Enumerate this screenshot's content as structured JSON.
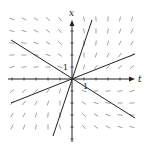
{
  "diagram": {
    "type": "direction-field",
    "axes": {
      "horizontal_label": "t",
      "vertical_label": "x",
      "tick_label_vertical": "1",
      "tick_label_horizontal": "1"
    },
    "origin_px": [
      72,
      79
    ],
    "unit_px": 12,
    "grid": {
      "cols": [
        -5,
        -4,
        -3,
        -2,
        -1,
        0,
        1,
        2,
        3,
        4,
        5
      ],
      "rows": [
        -4,
        -3,
        -2,
        -1,
        0,
        1,
        2,
        3,
        4,
        5
      ]
    },
    "lines": [
      {
        "name": "steep-line",
        "x1": 53,
        "y1": 136,
        "x2": 92,
        "y2": 20
      },
      {
        "name": "negative-slope-line",
        "x1": 11,
        "y1": 40,
        "x2": 135,
        "y2": 118
      },
      {
        "name": "positive-slope-line",
        "x1": 11,
        "y1": 103,
        "x2": 135,
        "y2": 54
      }
    ],
    "colors": {
      "ink": "#222222",
      "field": "#888888",
      "background": "#ffffff"
    }
  }
}
